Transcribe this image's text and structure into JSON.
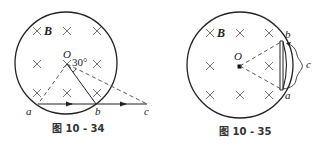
{
  "figures": [
    {
      "id": "fig1",
      "caption": "图 10 - 34",
      "field_label": "B",
      "center_label": "O",
      "angle_label": "30°",
      "point_labels": {
        "a": "a",
        "b": "b",
        "c": "c"
      },
      "elements": [
        "circular magnetic field region (into page)",
        "particle path a→b→c",
        "dashed radii from O",
        "30° angle mark"
      ]
    },
    {
      "id": "fig2",
      "caption": "图 10 - 35",
      "field_label": "B",
      "center_label": "O",
      "point_labels": {
        "a": "a",
        "b": "b",
        "c": "c"
      },
      "elements": [
        "circular magnetic field region (into page)",
        "conducting rod ab on chord",
        "arc wire c",
        "dashed lines from O to a and b"
      ]
    }
  ],
  "colors": {
    "line": "#222222",
    "dashed": "#444444",
    "cross": "#666666",
    "background": "#ffffff"
  }
}
